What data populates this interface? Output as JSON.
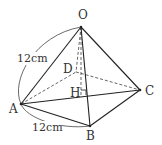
{
  "figure": {
    "type": "square pyramid",
    "vertices": {
      "O": {
        "label": "O",
        "x": 81,
        "y": 27,
        "lx": 83,
        "ly": 19
      },
      "A": {
        "label": "A",
        "x": 21,
        "y": 104,
        "lx": 13,
        "ly": 112
      },
      "B": {
        "label": "B",
        "x": 90,
        "y": 126,
        "lx": 91,
        "ly": 140
      },
      "C": {
        "label": "C",
        "x": 140,
        "y": 90,
        "lx": 149,
        "ly": 94
      },
      "D": {
        "label": "D",
        "x": 76,
        "y": 72,
        "lx": 68,
        "ly": 72
      },
      "H": {
        "label": "H",
        "x": 81,
        "y": 96,
        "lx": 73,
        "ly": 96
      }
    },
    "measurements": [
      {
        "name": "edge-OA",
        "text": "12cm",
        "x": 18,
        "y": 62
      },
      {
        "name": "edge-AB",
        "text": "12cm",
        "x": 33,
        "y": 131
      }
    ],
    "edges_solid": [
      "OA",
      "OB",
      "OC",
      "AB",
      "BC",
      "AC"
    ],
    "edges_dashed": [
      "OD",
      "AD",
      "DC",
      "OH"
    ],
    "right_angle_marker_at": "H"
  }
}
